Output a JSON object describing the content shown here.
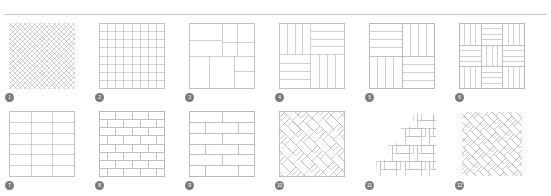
{
  "page": {
    "background_color": "#ffffff",
    "line_color": "#b5b5b5",
    "badge_color": "#7a7a7a",
    "badge_text_color": "#ffffff",
    "rule_color": "#c8c8c8"
  },
  "divider": {
    "name": "top-horizontal-rule"
  },
  "patterns": [
    {
      "number": "1",
      "label": "1",
      "name": "diagonal-diamond-grid",
      "style": "diagonal-grid",
      "description": "Fine 45-degree diagonal lattice of small diamonds",
      "rows": 14,
      "cols": 14
    },
    {
      "number": "2",
      "label": "2",
      "name": "stacked-square-grid",
      "style": "grid",
      "description": "Straight stacked square tile grid",
      "rows": 8,
      "cols": 8
    },
    {
      "number": "3",
      "label": "3",
      "name": "modular-random-block",
      "style": "modular",
      "description": "Modular mixed-size rectangular block layout",
      "rows": 0,
      "cols": 0
    },
    {
      "number": "4",
      "label": "4",
      "name": "plank-basketweave-quadrant",
      "style": "basketweave",
      "description": "Four quadrant plank basketweave with alternating direction",
      "rows": 2,
      "cols": 2
    },
    {
      "number": "5",
      "label": "5",
      "name": "double-basketweave",
      "style": "basketweave",
      "description": "Two by two basketweave of four-plank blocks",
      "rows": 2,
      "cols": 2
    },
    {
      "number": "6",
      "label": "6",
      "name": "pinwheel-basketweave",
      "style": "basketweave",
      "description": "Three by three pinwheel basketweave of plank blocks",
      "rows": 3,
      "cols": 3
    },
    {
      "number": "7",
      "label": "7",
      "name": "stacked-rectangular-grid",
      "style": "grid",
      "description": "Stack bond of wide rectangular tiles, three columns",
      "rows": 6,
      "cols": 3
    },
    {
      "number": "8",
      "label": "8",
      "name": "running-bond-small-brick",
      "style": "brick",
      "description": "Running bond brick pattern with small bricks, half offset",
      "rows": 8,
      "cols": 4
    },
    {
      "number": "9",
      "label": "9",
      "name": "running-bond-large-brick",
      "style": "brick",
      "description": "Running bond brick pattern with long planks, half offset",
      "rows": 6,
      "cols": 2
    },
    {
      "number": "10",
      "label": "10",
      "name": "diagonal-herringbone-framed",
      "style": "herringbone",
      "description": "Forty five degree herringbone clipped inside a square frame",
      "rows": 0,
      "cols": 0
    },
    {
      "number": "11",
      "label": "11",
      "name": "stepped-herringbone",
      "style": "herringbone",
      "description": "Straight herringbone with stepped staircase silhouette",
      "rows": 0,
      "cols": 0
    },
    {
      "number": "12",
      "label": "12",
      "name": "dense-diagonal-herringbone",
      "style": "herringbone",
      "description": "Dense diagonal herringbone of narrow planks",
      "rows": 0,
      "cols": 0
    }
  ]
}
